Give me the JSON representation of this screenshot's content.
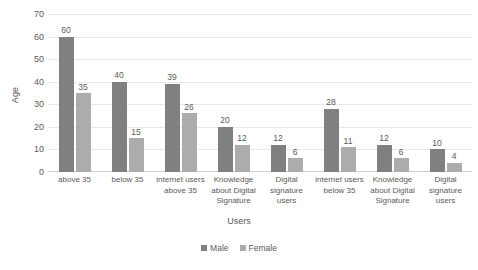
{
  "chart_data": {
    "type": "bar",
    "title": "",
    "xlabel": "Users",
    "ylabel": "Age",
    "ylim": [
      0,
      70
    ],
    "yticks": [
      0,
      10,
      20,
      30,
      40,
      50,
      60,
      70
    ],
    "grid": true,
    "legend_position": "bottom-center",
    "categories": [
      "above 35",
      "below 35",
      "internet users above 35",
      "Knowledge about Digital Signature",
      "Digital signature users",
      "internet users below 35",
      "Knowledge about Digital Signature",
      "Digital signature users"
    ],
    "series": [
      {
        "name": "Male",
        "color": "#808080",
        "values": [
          60,
          40,
          39,
          20,
          12,
          28,
          12,
          10
        ]
      },
      {
        "name": "Female",
        "color": "#acacac",
        "values": [
          35,
          15,
          26,
          12,
          6,
          11,
          6,
          4
        ]
      }
    ]
  }
}
